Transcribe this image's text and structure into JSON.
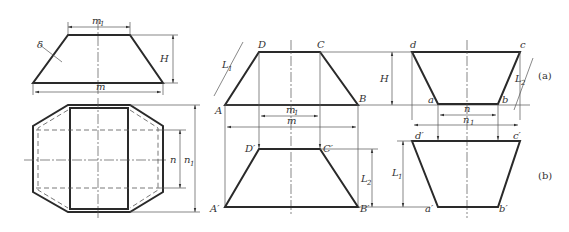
{
  "figure": {
    "captions": {
      "a": "(a)",
      "b": "(b)"
    },
    "left_views": {
      "front": {
        "top_width": "m",
        "top_width_sub": "1",
        "bottom_width": "m",
        "height": "H",
        "thickness": "δ"
      },
      "plan": {
        "inner": "n",
        "outer": "n",
        "outer_sub": "1"
      }
    },
    "middle_view": {
      "points": {
        "A": "A",
        "B": "B",
        "C": "C",
        "D": "D",
        "A2": "A′",
        "B2": "B′",
        "C2": "C′",
        "D2": "D′"
      },
      "dims": {
        "L1": "L",
        "L1_sub": "1",
        "L2": "L",
        "L2_sub": "2",
        "m1": "m",
        "m1_sub": "1",
        "m": "m",
        "H": "H"
      }
    },
    "right_view": {
      "points": {
        "a": "a",
        "b": "b",
        "c": "c",
        "d": "d",
        "a2": "a′",
        "b2": "b′",
        "c2": "c′",
        "d2": "d′"
      },
      "dims": {
        "n": "n",
        "n1": "n",
        "n1_sub": "1",
        "L1": "L",
        "L1_sub": "1",
        "L2": "L",
        "L2_sub": "2"
      }
    }
  }
}
